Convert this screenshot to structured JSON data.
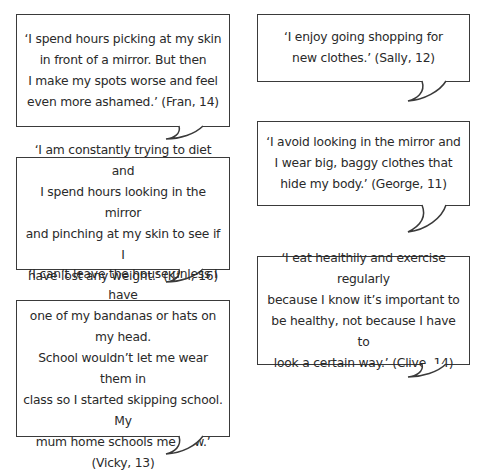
{
  "bubbles": [
    {
      "speaker": "Fran",
      "age": 14,
      "text": "‘I spend hours picking at my skin\nin front of a mirror. But then\nI make my spots worse and feel\neven more ashamed.’ (Fran, 14)"
    },
    {
      "speaker": "Karl",
      "age": 16,
      "text": "‘I am constantly trying to diet and\nI spend hours looking in the mirror\nand pinching at my skin to see if I\nhave lost any weight.’ (Karl, 16)"
    },
    {
      "speaker": "Vicky",
      "age": 13,
      "text": "‘I can’t leave the house unless I have\none of my bandanas or hats on my head.\nSchool wouldn’t let me wear them in\nclass so I started skipping school. My\nmum home schools me now.’ (Vicky, 13)"
    },
    {
      "speaker": "Sally",
      "age": 12,
      "text": "‘I enjoy going shopping for\nnew clothes.’ (Sally, 12)"
    },
    {
      "speaker": "George",
      "age": 11,
      "text": "‘I avoid looking in the mirror and\nI wear big, baggy clothes that\nhide my body.’ (George, 11)"
    },
    {
      "speaker": "Clive",
      "age": 14,
      "text": "‘I eat healthily and exercise regularly\nbecause I know it’s important to\nbe healthy, not because I have to\nlook a certain way.’ (Clive, 14)"
    }
  ],
  "colors": {
    "border": "#3a3a3a",
    "text": "#2a2a2a",
    "background": "#ffffff"
  }
}
